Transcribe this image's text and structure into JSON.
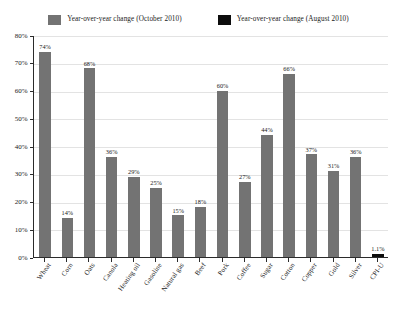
{
  "chart_data": {
    "type": "bar",
    "title": "",
    "subtitle": "",
    "xlabel": "",
    "ylabel": "",
    "ylim": [
      0,
      80
    ],
    "y_ticks": [
      "0%",
      "10%",
      "20%",
      "30%",
      "40%",
      "50%",
      "60%",
      "70%",
      "80%"
    ],
    "y_tick_values": [
      0,
      10,
      20,
      30,
      40,
      50,
      60,
      70,
      80
    ],
    "grid": true,
    "legend_position": "top",
    "categories": [
      "Wheat",
      "Corn",
      "Oats",
      "Canola",
      "Heating oil",
      "Gasoline",
      "Natural gas",
      "Beef",
      "Pork",
      "Coffee",
      "Sugar",
      "Cotton",
      "Copper",
      "Gold",
      "Silver",
      "CPI-U"
    ],
    "series": [
      {
        "name": "Year-over-year change (October 2010)",
        "color": "#737373",
        "values": [
          74,
          14,
          68,
          36,
          29,
          25,
          15,
          18,
          60,
          27,
          44,
          66,
          37,
          31,
          36,
          null
        ],
        "labels": [
          "74%",
          "14%",
          "68%",
          "36%",
          "29%",
          "25%",
          "15%",
          "18%",
          "60%",
          "27%",
          "44%",
          "66%",
          "37%",
          "31%",
          "36%",
          ""
        ]
      },
      {
        "name": "Year-over-year change (August 2010)",
        "color": "#0d0d0d",
        "values": [
          null,
          null,
          null,
          null,
          null,
          null,
          null,
          null,
          null,
          null,
          null,
          null,
          null,
          null,
          null,
          1.1
        ],
        "labels": [
          "",
          "",
          "",
          "",
          "",
          "",
          "",
          "",
          "",
          "",
          "",
          "",
          "",
          "",
          "",
          "1.1%"
        ]
      }
    ]
  },
  "legend": {
    "entries": [
      {
        "label": "Year-over-year change (October 2010)",
        "color": "#737373"
      },
      {
        "label": "Year-over-year change (August 2010)",
        "color": "#0d0d0d"
      }
    ]
  },
  "colors": {
    "bar_gray": "#737373",
    "bar_black": "#0d0d0d",
    "axis": "#2b2b2b",
    "gridline": "#e3e3e3",
    "background": "#ffffff"
  }
}
